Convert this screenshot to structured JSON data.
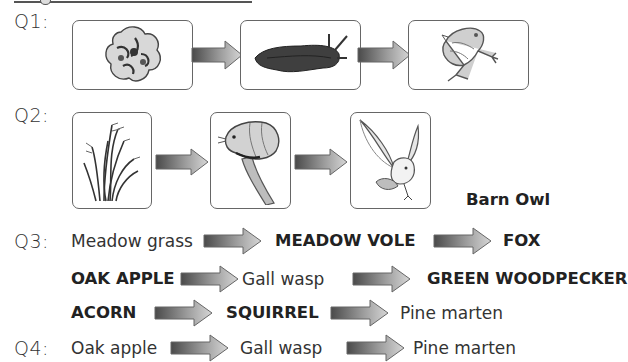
{
  "heading": {
    "text": ""
  },
  "questions": [
    {
      "label": "Q1:",
      "cards": [
        {
          "icon": "lettuce-icon",
          "name": "Lettuce"
        },
        {
          "icon": "slug-icon",
          "name": "Slug"
        },
        {
          "icon": "frog-icon",
          "name": "Frog"
        }
      ]
    },
    {
      "label": "Q2:",
      "cards": [
        {
          "icon": "grass-icon",
          "name": "Grass"
        },
        {
          "icon": "vole-icon",
          "name": "Vole"
        },
        {
          "icon": "owl-icon",
          "name": "Owl"
        }
      ],
      "answer": "Barn Owl"
    },
    {
      "label": "Q3:",
      "chains": [
        [
          {
            "text": "Meadow grass",
            "bold": false
          },
          {
            "text": "MEADOW VOLE",
            "bold": true
          },
          {
            "text": "FOX",
            "bold": true
          }
        ],
        [
          {
            "text": "OAK APPLE",
            "bold": true
          },
          {
            "text": "Gall wasp",
            "bold": false
          },
          {
            "text": "GREEN WOODPECKER",
            "bold": true
          }
        ],
        [
          {
            "text": "ACORN",
            "bold": true
          },
          {
            "text": "SQUIRREL",
            "bold": true
          },
          {
            "text": "Pine marten",
            "bold": false
          }
        ]
      ]
    },
    {
      "label": "Q4:",
      "chains": [
        [
          {
            "text": "Oak apple",
            "bold": false
          },
          {
            "text": "Gall wasp",
            "bold": false
          },
          {
            "text": "Pine marten",
            "bold": false
          }
        ]
      ]
    }
  ],
  "colors": {
    "arrow_dark": "#555555",
    "arrow_light": "#cfcfcf",
    "border": "#666666",
    "text": "#333333"
  }
}
